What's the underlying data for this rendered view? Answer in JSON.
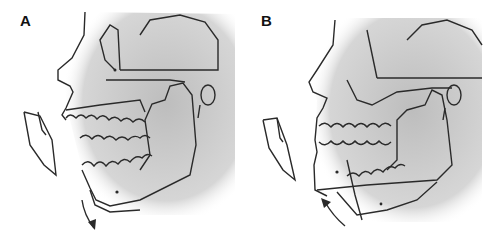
{
  "figure": {
    "panels": [
      {
        "label": "A",
        "description": "Lateral skull sketch with mandible open; arrow pointing downward below chin; incisor outline at left"
      },
      {
        "label": "B",
        "description": "Lateral skull sketch with mandible closed/advanced; arrow curving upward below chin; incisor outline at left"
      }
    ]
  },
  "colors": {
    "line": "#2a2a2a",
    "shade": "#c8c8c8",
    "background": "#ffffff"
  }
}
